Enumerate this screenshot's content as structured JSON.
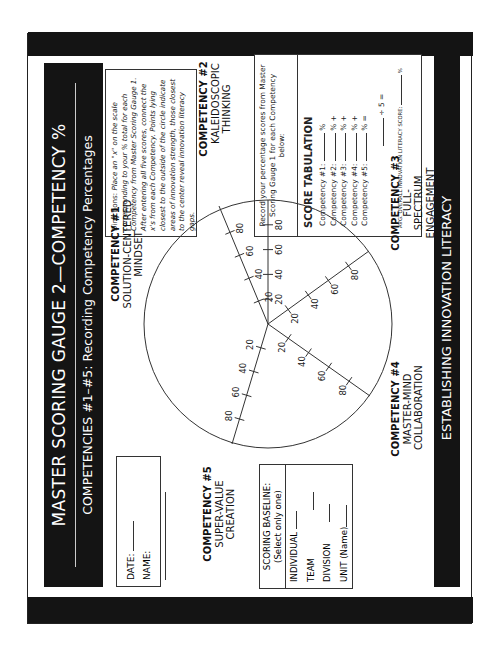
{
  "header": {
    "title": "MASTER SCORING GAUGE  2—COMPETENCY %",
    "subtitle": "COMPETENCIES #1–#5: Recording Competency Percentages"
  },
  "footer": {
    "text": "ESTABLISHING INNOVATION LITERACY"
  },
  "directions": {
    "label": "Directions:",
    "text": "Place an \"x\" on the scale corresponding to your % total for each Competency from Master Scoring Gauge 1. After entering all five scores, connect the x's from each Competency. Points lying closest to the outside of the circle indicate areas of innovation strength, those closest to the center reveal innovation literacy gaps."
  },
  "score_tabulation": {
    "intro": "Record your percentage scores from Master Scoring Gauge 1 for each Competency below:",
    "heading": "SCORE TABULATION",
    "rows": [
      {
        "label": "Competency #1:",
        "suffix": "%"
      },
      {
        "label": "Competency #2:",
        "suffix": "% +"
      },
      {
        "label": "Competency #3:",
        "suffix": "% +"
      },
      {
        "label": "Competency #4:",
        "suffix": "% +"
      },
      {
        "label": "Competency #5:",
        "suffix": "% ="
      }
    ],
    "divide": "÷ 5 =",
    "avg_label": "AVG. OVERALL INNOVATION LITERACY SCORE:",
    "avg_suffix": "%"
  },
  "form": {
    "date_label": "DATE:",
    "name_label": "NAME:"
  },
  "scoring_baseline": {
    "heading": "SCORING BASELINE:",
    "subheading": "(Select only one)",
    "options": [
      "INDIVIDUAL",
      "TEAM",
      "DIVISION",
      "UNIT (Name)"
    ]
  },
  "competencies": [
    {
      "number": "COMPETENCY #1",
      "name": "SOLUTION-CENTERED MINDSET"
    },
    {
      "number": "COMPETENCY #2",
      "name": "KALEIDOSCOPIC THINKING"
    },
    {
      "number": "COMPETENCY #3",
      "name": "FULL-SPECTRUM ENGAGEMENT"
    },
    {
      "number": "COMPETENCY #4",
      "name": "MASTER-MIND COLLABORATION"
    },
    {
      "number": "COMPETENCY #5",
      "name": "SUPER-VALUE CREATION"
    }
  ],
  "chart_data": {
    "type": "radar",
    "axes": [
      "Competency #1",
      "Competency #2",
      "Competency #3",
      "Competency #4",
      "Competency #5"
    ],
    "tick_labels": [
      "20",
      "40",
      "60",
      "80"
    ],
    "range": [
      0,
      100
    ],
    "values": []
  },
  "colors": {
    "band": "#141414",
    "ink": "#222222",
    "paper": "#ffffff"
  }
}
